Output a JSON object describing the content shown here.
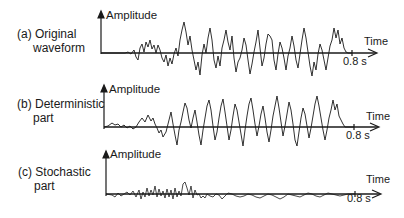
{
  "panels": [
    {
      "id": "a",
      "label_line1": "(a) Original",
      "label_line2": "waveform",
      "y_axis_label": "Amplitude",
      "x_axis_label": "Time",
      "end_tick_label": "0.8 s"
    },
    {
      "id": "b",
      "label_line1": "(b) Deterministic",
      "label_line2": "part",
      "y_axis_label": "Amplitude",
      "x_axis_label": "Time",
      "end_tick_label": "0.8 s"
    },
    {
      "id": "c",
      "label_line1": "(c) Stochastic",
      "label_line2": "part",
      "y_axis_label": "Amplitude",
      "x_axis_label": "Time",
      "end_tick_label": "0.8 s"
    }
  ],
  "colors": {
    "line": "#1a1a1a",
    "background": "#ffffff"
  }
}
